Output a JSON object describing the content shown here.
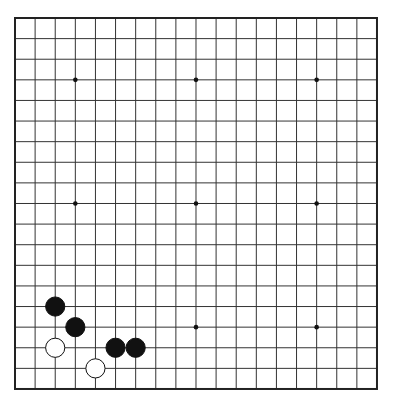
{
  "board": {
    "size": 19,
    "origin_x": 15,
    "origin_y": 18,
    "step_x": 20.11,
    "step_y": 20.61,
    "background": "#ffffff",
    "line_color": "#333333",
    "border_color": "#222222",
    "star_points": [
      [
        3,
        3
      ],
      [
        9,
        3
      ],
      [
        15,
        3
      ],
      [
        3,
        9
      ],
      [
        9,
        9
      ],
      [
        15,
        9
      ],
      [
        3,
        15
      ],
      [
        9,
        15
      ],
      [
        15,
        15
      ]
    ],
    "stones": [
      {
        "color": "black",
        "col": 2,
        "row": 14
      },
      {
        "color": "black",
        "col": 3,
        "row": 15
      },
      {
        "color": "white",
        "col": 2,
        "row": 16
      },
      {
        "color": "black",
        "col": 5,
        "row": 16
      },
      {
        "color": "black",
        "col": 6,
        "row": 16
      },
      {
        "color": "white",
        "col": 4,
        "row": 17
      }
    ]
  }
}
